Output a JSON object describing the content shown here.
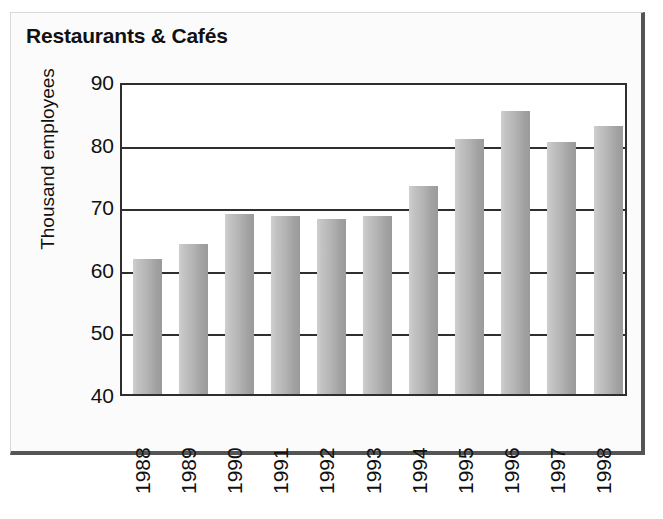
{
  "chart_data": {
    "type": "bar",
    "title": "Restaurants & Cafés",
    "xlabel": "",
    "ylabel": "Thousand employees",
    "categories": [
      "1988",
      "1989",
      "1990",
      "1991",
      "1992",
      "1993",
      "1994",
      "1995",
      "1996",
      "1997",
      "1998"
    ],
    "values": [
      61.5,
      64.0,
      68.7,
      68.5,
      68.0,
      68.4,
      73.2,
      80.7,
      85.2,
      80.2,
      82.8
    ],
    "series": [
      {
        "name": "Thousand employees",
        "values": [
          61.5,
          64.0,
          68.7,
          68.5,
          68.0,
          68.4,
          73.2,
          80.7,
          85.2,
          80.2,
          82.8
        ]
      }
    ],
    "ylim": [
      40,
      90
    ],
    "ytick_labels": [
      "90",
      "80",
      "70",
      "60",
      "50",
      "40"
    ],
    "ytick_values": [
      90,
      80,
      70,
      60,
      50,
      40
    ],
    "ytick_step": 10,
    "grid": true,
    "grid_axis": "y",
    "legend": false,
    "legend_position": "none",
    "bar_color": "#b4b4b4",
    "axis_color": "#2e2e2e",
    "text_color": "#111111",
    "background_color": "#ffffff",
    "xtick_rotation": -90,
    "ylabel_rotation": -90
  }
}
